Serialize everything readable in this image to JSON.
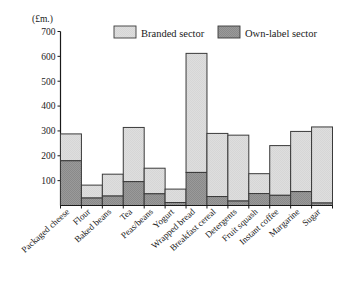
{
  "chart_data": {
    "type": "bar",
    "stacked": true,
    "title": "",
    "subtitle": "",
    "xlabel": "",
    "ylabel": "(£m.)",
    "ylim": [
      0,
      700
    ],
    "yticks": [
      100,
      200,
      300,
      400,
      500,
      600,
      700
    ],
    "ytick_labels": [
      "100",
      "200",
      "300",
      "400",
      "500",
      "600",
      "700"
    ],
    "grid": false,
    "legend_position": "top",
    "categories": [
      "Packaged cheese",
      "Flour",
      "Baked beans",
      "Tea",
      "Peas/beans",
      "Yogurt",
      "Wrapped bread",
      "Breakfast cereal",
      "Detergents",
      "Fruit squash",
      "Instant coffee",
      "Margarine",
      "Sugar"
    ],
    "series": [
      {
        "name": "Own-label sector",
        "color": "#9a9a9a",
        "values": [
          180,
          30,
          38,
          96,
          47,
          12,
          133,
          36,
          18,
          48,
          41,
          56,
          10
        ]
      },
      {
        "name": "Branded sector",
        "color": "#dcdcdc",
        "values": [
          108,
          52,
          88,
          218,
          103,
          54,
          479,
          254,
          265,
          80,
          200,
          242,
          306
        ]
      }
    ],
    "totals": [
      288,
      82,
      126,
      314,
      150,
      66,
      612,
      290,
      283,
      128,
      241,
      298,
      316
    ]
  },
  "legend": {
    "items": [
      {
        "label": "Branded sector",
        "color": "#dcdcdc",
        "swatch_name": "branded-sector-swatch"
      },
      {
        "label": "Own-label sector",
        "color": "#9a9a9a",
        "swatch_name": "own-label-sector-swatch"
      }
    ]
  },
  "colors": {
    "branded": "#dcdcdc",
    "own_label": "#9a9a9a",
    "stroke": "#3a3a3a",
    "axis": "#1a1a1a",
    "background": "#ffffff"
  }
}
